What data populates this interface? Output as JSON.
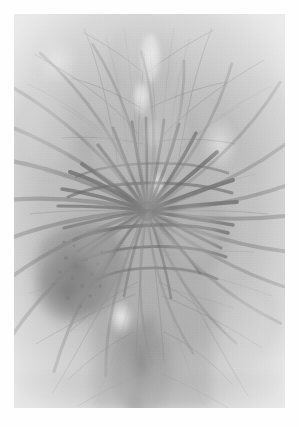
{
  "page": {
    "kind": "photographic-plate",
    "background_color": "#fefefe",
    "width_px": 299,
    "height_px": 427
  },
  "figure": {
    "title": "",
    "caption": "",
    "modality": "grayscale photomicrograph / cleared-specimen print",
    "frame": {
      "left_px": 14,
      "top_px": 14,
      "width_px": 271,
      "height_px": 394,
      "border": "none"
    },
    "tones": {
      "paper_white": "#fefefe",
      "field_light": "#d7d7d7",
      "field_mid": "#bcbcbc",
      "field_mid_dark": "#a3a3a3",
      "field_dark": "#8a8a8a",
      "vessel_dark": "#6e6e6e",
      "vessel_darkest": "#555555",
      "highlight": "#ececec"
    },
    "regions": [
      {
        "name": "upper-stalk",
        "note": "pale vertical band with fine branching strands",
        "cx": 0.5,
        "cy": 0.18
      },
      {
        "name": "central-hilum",
        "note": "convergence point of radiating vessels",
        "cx": 0.49,
        "cy": 0.5
      },
      {
        "name": "left-dark-patch",
        "note": "mottled dark granular zone left of centre",
        "cx": 0.24,
        "cy": 0.66
      },
      {
        "name": "lower-stalk",
        "note": "descending darker vertical band",
        "cx": 0.46,
        "cy": 0.87
      },
      {
        "name": "right-field",
        "note": "lighter diffuse field with sparse fine filaments",
        "cx": 0.8,
        "cy": 0.42
      }
    ]
  },
  "chart_data": {
    "type": "heatmap",
    "title": "",
    "xlabel": "",
    "ylabel": "",
    "grid": false,
    "legend": "none",
    "colormap": "grayscale",
    "value_range": [
      0,
      255
    ],
    "note": "Luminance field of the printed plate; low values are dark vessel ink, high values are pale background paper.",
    "radial_vessels": [
      {
        "angle_deg": 196,
        "length": 0.4,
        "width": 4.2,
        "darkness": 0.56
      },
      {
        "angle_deg": 208,
        "length": 0.42,
        "width": 3.6,
        "darkness": 0.52
      },
      {
        "angle_deg": 221,
        "length": 0.4,
        "width": 3.2,
        "darkness": 0.5
      },
      {
        "angle_deg": 236,
        "length": 0.37,
        "width": 3.0,
        "darkness": 0.48
      },
      {
        "angle_deg": 252,
        "length": 0.34,
        "width": 2.8,
        "darkness": 0.46
      },
      {
        "angle_deg": 268,
        "length": 0.31,
        "width": 2.6,
        "darkness": 0.44
      },
      {
        "angle_deg": 284,
        "length": 0.3,
        "width": 2.6,
        "darkness": 0.44
      },
      {
        "angle_deg": 300,
        "length": 0.33,
        "width": 2.8,
        "darkness": 0.46
      },
      {
        "angle_deg": 316,
        "length": 0.36,
        "width": 3.0,
        "darkness": 0.48
      },
      {
        "angle_deg": 331,
        "length": 0.39,
        "width": 3.4,
        "darkness": 0.5
      },
      {
        "angle_deg": 345,
        "length": 0.41,
        "width": 3.8,
        "darkness": 0.53
      },
      {
        "angle_deg": 357,
        "length": 0.42,
        "width": 4.0,
        "darkness": 0.55
      },
      {
        "angle_deg": 12,
        "length": 0.4,
        "width": 3.8,
        "darkness": 0.53
      },
      {
        "angle_deg": 26,
        "length": 0.38,
        "width": 3.4,
        "darkness": 0.5
      },
      {
        "angle_deg": 40,
        "length": 0.34,
        "width": 3.0,
        "darkness": 0.47
      },
      {
        "angle_deg": 56,
        "length": 0.31,
        "width": 2.8,
        "darkness": 0.45
      },
      {
        "angle_deg": 72,
        "length": 0.29,
        "width": 2.6,
        "darkness": 0.44
      },
      {
        "angle_deg": 88,
        "length": 0.3,
        "width": 2.6,
        "darkness": 0.44
      },
      {
        "angle_deg": 104,
        "length": 0.33,
        "width": 2.8,
        "darkness": 0.46
      },
      {
        "angle_deg": 120,
        "length": 0.36,
        "width": 3.2,
        "darkness": 0.49
      },
      {
        "angle_deg": 136,
        "length": 0.39,
        "width": 3.6,
        "darkness": 0.52
      },
      {
        "angle_deg": 150,
        "length": 0.41,
        "width": 3.8,
        "darkness": 0.54
      },
      {
        "angle_deg": 164,
        "length": 0.41,
        "width": 4.0,
        "darkness": 0.55
      },
      {
        "angle_deg": 180,
        "length": 0.4,
        "width": 4.2,
        "darkness": 0.56
      }
    ],
    "dark_blobs": [
      {
        "cx": 0.245,
        "cy": 0.645,
        "rx": 0.115,
        "ry": 0.105,
        "darkness": 0.4
      },
      {
        "cx": 0.205,
        "cy": 0.7,
        "rx": 0.085,
        "ry": 0.075,
        "darkness": 0.44
      },
      {
        "cx": 0.3,
        "cy": 0.6,
        "rx": 0.07,
        "ry": 0.07,
        "darkness": 0.32
      },
      {
        "cx": 0.47,
        "cy": 0.905,
        "rx": 0.07,
        "ry": 0.11,
        "darkness": 0.36
      },
      {
        "cx": 0.5,
        "cy": 0.485,
        "rx": 0.055,
        "ry": 0.06,
        "darkness": 0.3
      },
      {
        "cx": 0.66,
        "cy": 0.56,
        "rx": 0.09,
        "ry": 0.08,
        "darkness": 0.22
      },
      {
        "cx": 0.38,
        "cy": 0.35,
        "rx": 0.09,
        "ry": 0.085,
        "darkness": 0.2
      },
      {
        "cx": 0.56,
        "cy": 0.3,
        "rx": 0.08,
        "ry": 0.09,
        "darkness": 0.18
      },
      {
        "cx": 0.47,
        "cy": 0.12,
        "rx": 0.075,
        "ry": 0.09,
        "darkness": 0.16
      },
      {
        "cx": 0.85,
        "cy": 0.78,
        "rx": 0.09,
        "ry": 0.09,
        "darkness": 0.14
      },
      {
        "cx": 0.12,
        "cy": 0.3,
        "rx": 0.09,
        "ry": 0.1,
        "darkness": 0.13
      }
    ],
    "highlights": [
      {
        "cx": 0.505,
        "cy": 0.105,
        "rx": 0.035,
        "ry": 0.055,
        "strength": 0.52
      },
      {
        "cx": 0.47,
        "cy": 0.205,
        "rx": 0.03,
        "ry": 0.04,
        "strength": 0.42
      },
      {
        "cx": 0.53,
        "cy": 0.43,
        "rx": 0.03,
        "ry": 0.035,
        "strength": 0.38
      },
      {
        "cx": 0.395,
        "cy": 0.77,
        "rx": 0.045,
        "ry": 0.045,
        "strength": 0.4
      },
      {
        "cx": 0.76,
        "cy": 0.33,
        "rx": 0.07,
        "ry": 0.07,
        "strength": 0.3
      },
      {
        "cx": 0.16,
        "cy": 0.12,
        "rx": 0.08,
        "ry": 0.08,
        "strength": 0.26
      }
    ]
  }
}
